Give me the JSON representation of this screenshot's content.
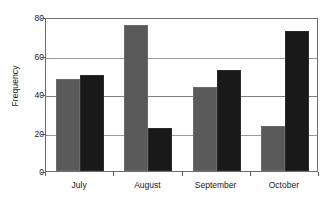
{
  "chart_data": {
    "type": "bar",
    "title": "",
    "subtitle": "",
    "xlabel": "",
    "ylabel": "Frequency",
    "categories": [
      "July",
      "August",
      "September",
      "October"
    ],
    "series": [
      {
        "name": "Series 1",
        "color": "#5a5a5a",
        "values": [
          48,
          76,
          43.5,
          23.5
        ]
      },
      {
        "name": "Series 2",
        "color": "#191919",
        "values": [
          50,
          22.5,
          52.5,
          72.5
        ]
      }
    ],
    "ylim": [
      0,
      80
    ],
    "yticks": [
      0,
      20,
      40,
      60,
      80
    ],
    "ytick_labels": [
      "0",
      "20",
      "40",
      "60",
      "80"
    ],
    "grid": true,
    "grid_axis": "y",
    "legend": false,
    "legend_position": "none"
  }
}
